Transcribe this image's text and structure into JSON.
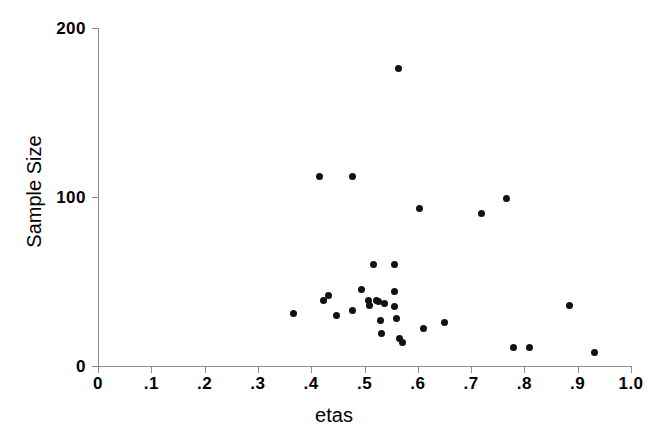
{
  "chart_data": {
    "type": "scatter",
    "title": "",
    "xlabel": "etas",
    "ylabel": "Sample Size",
    "xlim": [
      0,
      1.0
    ],
    "ylim": [
      0,
      200
    ],
    "grid": false,
    "legend": null,
    "x_ticks": [
      "0",
      ".1",
      ".2",
      ".3",
      ".4",
      ".5",
      ".6",
      ".7",
      ".8",
      ".9",
      "1.0"
    ],
    "x_tick_values": [
      0,
      0.1,
      0.2,
      0.3,
      0.4,
      0.5,
      0.6,
      0.7,
      0.8,
      0.9,
      1.0
    ],
    "y_ticks": [
      "0",
      "100",
      "200"
    ],
    "y_tick_values": [
      0,
      100,
      200
    ],
    "marker": "filled-circle",
    "marker_color": "#111111",
    "axis_color": "#8a8a8a",
    "points": [
      {
        "x": 0.366,
        "y": 31
      },
      {
        "x": 0.415,
        "y": 112
      },
      {
        "x": 0.424,
        "y": 39
      },
      {
        "x": 0.432,
        "y": 42
      },
      {
        "x": 0.447,
        "y": 30
      },
      {
        "x": 0.477,
        "y": 112
      },
      {
        "x": 0.478,
        "y": 33
      },
      {
        "x": 0.495,
        "y": 45
      },
      {
        "x": 0.508,
        "y": 39
      },
      {
        "x": 0.509,
        "y": 36
      },
      {
        "x": 0.517,
        "y": 60
      },
      {
        "x": 0.523,
        "y": 39
      },
      {
        "x": 0.527,
        "y": 38
      },
      {
        "x": 0.53,
        "y": 27
      },
      {
        "x": 0.531,
        "y": 19
      },
      {
        "x": 0.537,
        "y": 37
      },
      {
        "x": 0.556,
        "y": 60
      },
      {
        "x": 0.556,
        "y": 44
      },
      {
        "x": 0.557,
        "y": 35
      },
      {
        "x": 0.56,
        "y": 28
      },
      {
        "x": 0.563,
        "y": 176
      },
      {
        "x": 0.566,
        "y": 16
      },
      {
        "x": 0.571,
        "y": 14
      },
      {
        "x": 0.604,
        "y": 93
      },
      {
        "x": 0.611,
        "y": 22
      },
      {
        "x": 0.65,
        "y": 26
      },
      {
        "x": 0.719,
        "y": 90
      },
      {
        "x": 0.767,
        "y": 99
      },
      {
        "x": 0.779,
        "y": 11
      },
      {
        "x": 0.81,
        "y": 11
      },
      {
        "x": 0.885,
        "y": 36
      },
      {
        "x": 0.932,
        "y": 8
      }
    ]
  }
}
